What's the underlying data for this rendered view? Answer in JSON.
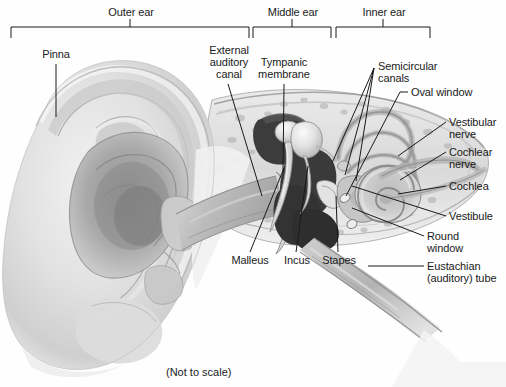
{
  "figure": {
    "title_note": "(Not to scale)",
    "background_color": "#fefefe",
    "line_color": "#1a1a1a"
  },
  "brackets": [
    {
      "id": "outer-ear",
      "label": "Outer ear"
    },
    {
      "id": "middle-ear",
      "label": "Middle ear"
    },
    {
      "id": "inner-ear",
      "label": "Inner ear"
    }
  ],
  "labels": {
    "pinna": "Pinna",
    "external_auditory_canal_l1": "External",
    "external_auditory_canal_l2": "auditory",
    "external_auditory_canal_l3": "canal",
    "tympanic_membrane_l1": "Tympanic",
    "tympanic_membrane_l2": "membrane",
    "semicircular_canals_l1": "Semicircular",
    "semicircular_canals_l2": "canals",
    "oval_window": "Oval window",
    "vestibular_nerve_l1": "Vestibular",
    "vestibular_nerve_l2": "nerve",
    "cochlear_nerve_l1": "Cochlear",
    "cochlear_nerve_l2": "nerve",
    "cochlea": "Cochlea",
    "vestibule": "Vestibule",
    "round_window_l1": "Round",
    "round_window_l2": "window",
    "eustachian_tube_l1": "Eustachian",
    "eustachian_tube_l2": "(auditory) tube",
    "malleus": "Malleus",
    "incus": "Incus",
    "stapes": "Stapes"
  }
}
